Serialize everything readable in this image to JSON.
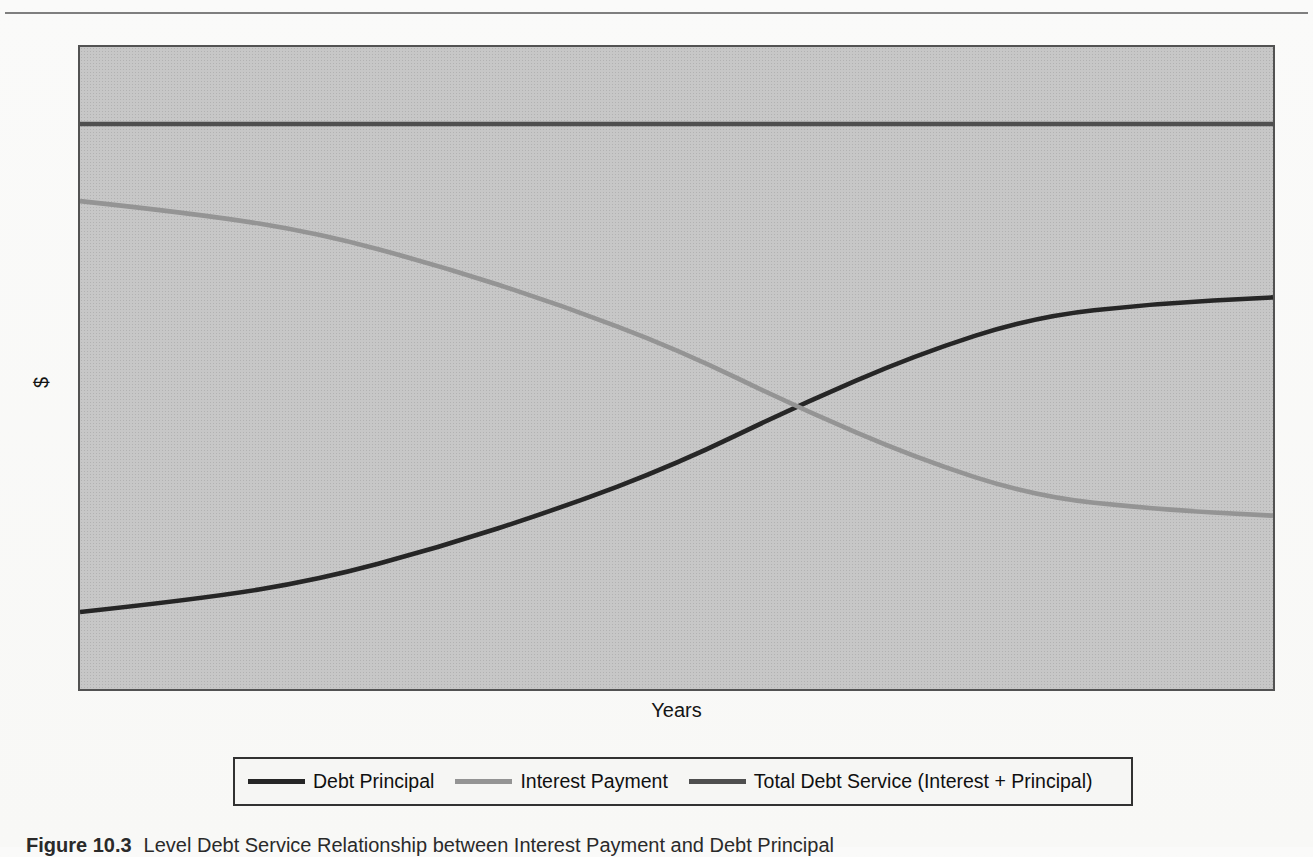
{
  "chart_data": {
    "type": "line",
    "title": "",
    "xlabel": "Years",
    "ylabel": "$",
    "x": [
      0,
      1,
      2,
      3,
      4,
      5,
      6,
      7,
      8,
      9,
      10
    ],
    "x_range": [
      0,
      10
    ],
    "value_range": [
      0,
      100
    ],
    "tick_labels": "none (conceptual chart, no numeric scale shown)",
    "grid": false,
    "legend_position": "bottom",
    "plot_background": "#c7c7c7",
    "series": [
      {
        "id": "debt-principal",
        "name": "Debt Principal",
        "color": "#262626",
        "values": [
          12,
          14,
          17,
          22,
          28,
          35,
          44,
          52,
          58,
          60,
          61
        ]
      },
      {
        "id": "interest-payment",
        "name": "Interest Payment",
        "color": "#949494",
        "values": [
          76,
          74,
          71,
          66,
          60,
          53,
          44,
          36,
          30,
          28,
          27
        ]
      },
      {
        "id": "total-debt-service",
        "name": "Total Debt Service (Interest + Principal)",
        "color": "#4f4f4f",
        "values": [
          88,
          88,
          88,
          88,
          88,
          88,
          88,
          88,
          88,
          88,
          88
        ]
      }
    ]
  },
  "caption": {
    "figure_label": "Figure 10.3",
    "text": "Level Debt Service Relationship between Interest Payment and Debt Principal"
  }
}
